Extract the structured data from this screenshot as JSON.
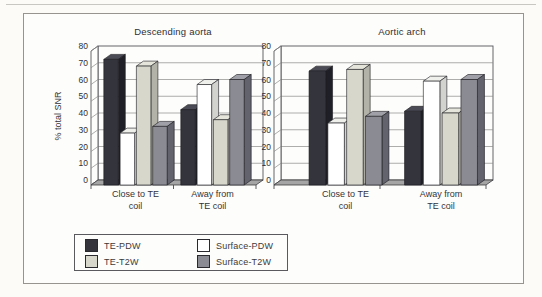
{
  "figure": {
    "background": "#fcfbf8",
    "frame_border_color": "#97948f",
    "text_color": "#3b3b3b",
    "gridline_color": "#8a8a8a",
    "floor_color": "#a5a5a5"
  },
  "axis": {
    "ylabel": "% total SNR",
    "ymin": 0,
    "ymax": 80,
    "tick_step": 10,
    "tick_labels": [
      "0",
      "10",
      "20",
      "30",
      "40",
      "50",
      "60",
      "70",
      "80"
    ]
  },
  "series_styles": [
    {
      "name": "TE-PDW",
      "front": "#34343d",
      "top": "#4b4b55",
      "side": "#1f1f27"
    },
    {
      "name": "Surface-PDW",
      "front": "#ffffff",
      "top": "#efefec",
      "side": "#d2d2cf"
    },
    {
      "name": "TE-T2W",
      "front": "#d8d7cc",
      "top": "#e6e5db",
      "side": "#b3b2a8"
    },
    {
      "name": "Surface-T2W",
      "front": "#8b8b93",
      "top": "#a0a0a8",
      "side": "#63636e"
    }
  ],
  "legend": {
    "position": "bottom-left",
    "items": [
      {
        "label": "TE-PDW",
        "color": "#34343d"
      },
      {
        "label": "Surface-PDW",
        "color": "#ffffff"
      },
      {
        "label": "TE-T2W",
        "color": "#d8d7cc"
      },
      {
        "label": "Surface-T2W",
        "color": "#8b8b93"
      }
    ]
  },
  "chart_data": [
    {
      "type": "bar",
      "title": "Descending aorta",
      "ylabel": "% total SNR",
      "ylim": [
        0,
        80
      ],
      "grid": true,
      "legend_position": "bottom-left",
      "categories": [
        "Close to TE coil",
        "Away from TE coil"
      ],
      "category_lines": [
        [
          "Close to TE",
          "coil"
        ],
        [
          "Away from",
          "TE coil"
        ]
      ],
      "series": [
        {
          "name": "TE-PDW",
          "values": [
            72,
            42
          ]
        },
        {
          "name": "Surface-PDW",
          "values": [
            28,
            57
          ]
        },
        {
          "name": "TE-T2W",
          "values": [
            68,
            36
          ]
        },
        {
          "name": "Surface-T2W",
          "values": [
            32,
            60
          ]
        }
      ]
    },
    {
      "type": "bar",
      "title": "Aortic arch",
      "ylabel": "",
      "ylim": [
        0,
        80
      ],
      "grid": true,
      "categories": [
        "Close to TE coil",
        "Away from TE coil"
      ],
      "category_lines": [
        [
          "Close to TE",
          "coil"
        ],
        [
          "Away from",
          "TE coil"
        ]
      ],
      "series": [
        {
          "name": "TE-PDW",
          "values": [
            65,
            41
          ]
        },
        {
          "name": "Surface-PDW",
          "values": [
            34,
            59
          ]
        },
        {
          "name": "TE-T2W",
          "values": [
            66,
            40
          ]
        },
        {
          "name": "Surface-T2W",
          "values": [
            38,
            60
          ]
        }
      ]
    }
  ]
}
